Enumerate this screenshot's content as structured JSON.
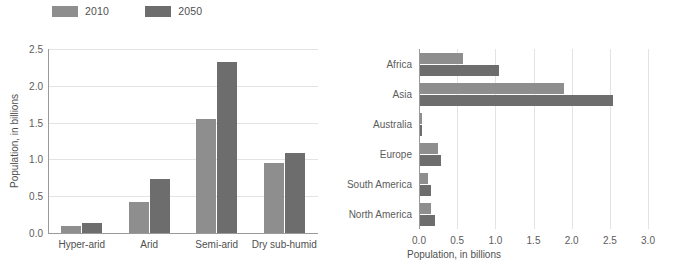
{
  "legend": {
    "items": [
      {
        "label": "2010",
        "color": "#8e8e8e"
      },
      {
        "label": "2050",
        "color": "#6d6d6d"
      }
    ]
  },
  "colors": {
    "series_2010": "#8e8e8e",
    "series_2050": "#6d6d6d",
    "gridline": "#e3e3e3",
    "axis": "#9a9a9a",
    "text": "#5c5c5c",
    "background": "#ffffff"
  },
  "chart_data": [
    {
      "type": "bar",
      "orientation": "vertical",
      "title": "",
      "xlabel": "",
      "ylabel": "Population, in billions",
      "categories": [
        "Hyper-arid",
        "Arid",
        "Semi-arid",
        "Dry sub-humid"
      ],
      "series": [
        {
          "name": "2010",
          "color": "#8e8e8e",
          "values": [
            0.09,
            0.42,
            1.55,
            0.95
          ]
        },
        {
          "name": "2050",
          "color": "#6d6d6d",
          "values": [
            0.13,
            0.74,
            2.32,
            1.09
          ]
        }
      ],
      "ylim": [
        0.0,
        2.5
      ],
      "yticks": [
        "0.0",
        "0.5",
        "1.0",
        "1.5",
        "2.0",
        "2.5"
      ],
      "ytick_values": [
        0.0,
        0.5,
        1.0,
        1.5,
        2.0,
        2.5
      ],
      "grid": true,
      "legend_position": "top-left"
    },
    {
      "type": "bar",
      "orientation": "horizontal",
      "title": "",
      "xlabel": "Population, in billions",
      "ylabel": "",
      "categories": [
        "Africa",
        "Asia",
        "Australia",
        "Europe",
        "South America",
        "North America"
      ],
      "series": [
        {
          "name": "2010",
          "color": "#8e8e8e",
          "values": [
            0.56,
            1.89,
            0.02,
            0.23,
            0.11,
            0.15
          ]
        },
        {
          "name": "2050",
          "color": "#6d6d6d",
          "values": [
            1.04,
            2.53,
            0.03,
            0.27,
            0.14,
            0.2
          ]
        }
      ],
      "xlim": [
        0.0,
        3.0
      ],
      "xticks": [
        "0.0",
        "0.5",
        "1.0",
        "1.5",
        "2.0",
        "2.5",
        "3.0"
      ],
      "xtick_values": [
        0.0,
        0.5,
        1.0,
        1.5,
        2.0,
        2.5,
        3.0
      ],
      "grid": true,
      "legend_position": "shared-top-left"
    }
  ]
}
